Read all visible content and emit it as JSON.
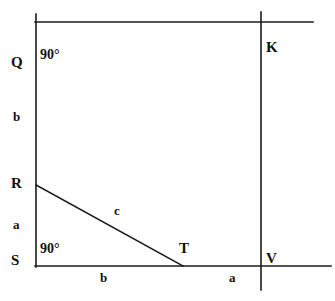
{
  "diagram": {
    "type": "geometry-figure",
    "stroke_color": "#1a1a1a",
    "background_color": "#ffffff",
    "vertices": [
      {
        "id": "Q",
        "label": "Q",
        "x": 36,
        "y": 22
      },
      {
        "id": "R",
        "label": "R",
        "x": 36,
        "y": 185
      },
      {
        "id": "S",
        "label": "S",
        "x": 36,
        "y": 266
      },
      {
        "id": "T",
        "label": "T",
        "x": 182,
        "y": 266
      },
      {
        "id": "K",
        "label": "K",
        "x": 261,
        "y": 22
      },
      {
        "id": "V",
        "label": "V",
        "x": 261,
        "y": 266
      }
    ],
    "sides": [
      {
        "id": "b-left",
        "label": "b",
        "between": "Q-R"
      },
      {
        "id": "a-left",
        "label": "a",
        "between": "R-S"
      },
      {
        "id": "b-bottom",
        "label": "b",
        "between": "S-T"
      },
      {
        "id": "a-bottom",
        "label": "a",
        "between": "T-V"
      },
      {
        "id": "c-diag",
        "label": "c",
        "between": "R-T"
      }
    ],
    "angles": [
      {
        "id": "angle-top",
        "label": "90°",
        "at": "Q"
      },
      {
        "id": "angle-bottom",
        "label": "90°",
        "at": "S"
      }
    ],
    "segments": [
      {
        "id": "left-vertical",
        "x1": 36,
        "y1": 14,
        "x2": 36,
        "y2": 267
      },
      {
        "id": "top-horizontal",
        "x1": 35,
        "y1": 22,
        "x2": 313,
        "y2": 22
      },
      {
        "id": "bottom-horizontal",
        "x1": 35,
        "y1": 266,
        "x2": 331,
        "y2": 266
      },
      {
        "id": "right-vertical",
        "x1": 261,
        "y1": 12,
        "x2": 261,
        "y2": 290
      },
      {
        "id": "diagonal-rt",
        "x1": 36,
        "y1": 185,
        "x2": 183,
        "y2": 266
      }
    ]
  }
}
